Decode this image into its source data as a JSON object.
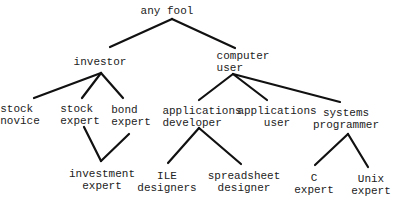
{
  "diagram": {
    "type": "hierarchy-tree",
    "nodes": {
      "any_fool": {
        "lines": [
          "any fool"
        ]
      },
      "investor": {
        "lines": [
          "investor"
        ]
      },
      "computer_user": {
        "lines": [
          "computer",
          "user"
        ]
      },
      "stock_novice": {
        "lines": [
          "stock",
          "novice"
        ]
      },
      "stock_expert": {
        "lines": [
          "stock",
          "expert"
        ]
      },
      "bond_expert": {
        "lines": [
          "bond",
          "expert"
        ]
      },
      "applications_developer": {
        "lines": [
          "applications",
          "developer"
        ]
      },
      "applications_user": {
        "lines": [
          "applications",
          "user"
        ]
      },
      "systems_programmer": {
        "lines": [
          "systems",
          "programmer"
        ]
      },
      "investment_expert": {
        "lines": [
          "investment",
          "expert"
        ]
      },
      "ile_designers": {
        "lines": [
          "ILE",
          "designers"
        ]
      },
      "spreadsheet_designer": {
        "lines": [
          "spreadsheet",
          "designer"
        ]
      },
      "c_expert": {
        "lines": [
          "C",
          "expert"
        ]
      },
      "unix_expert": {
        "lines": [
          "Unix",
          "expert"
        ]
      }
    },
    "edges": [
      [
        "any fool",
        "investor"
      ],
      [
        "any fool",
        "computer user"
      ],
      [
        "investor",
        "stock novice"
      ],
      [
        "investor",
        "stock expert"
      ],
      [
        "investor",
        "bond expert"
      ],
      [
        "stock expert",
        "investment expert"
      ],
      [
        "bond expert",
        "investment expert"
      ],
      [
        "computer user",
        "applications developer"
      ],
      [
        "computer user",
        "applications user"
      ],
      [
        "computer user",
        "systems programmer"
      ],
      [
        "applications developer",
        "ILE designers"
      ],
      [
        "applications developer",
        "spreadsheet designer"
      ],
      [
        "systems programmer",
        "C expert"
      ],
      [
        "systems programmer",
        "Unix expert"
      ]
    ],
    "colors": {
      "line": "#111111",
      "text": "#222222",
      "background": "#ffffff"
    }
  }
}
